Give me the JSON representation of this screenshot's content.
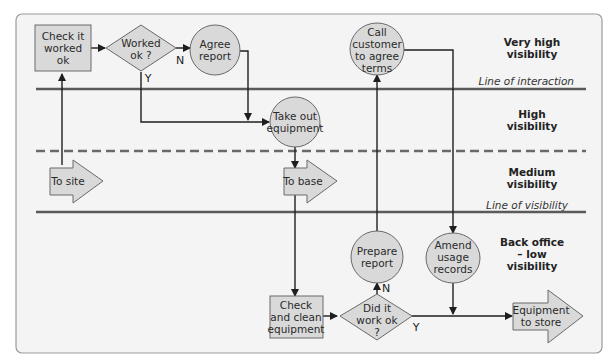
{
  "diagram": {
    "type": "service blueprint",
    "colors": {
      "background": "#f4f4f4",
      "frame": "#9a9a9a",
      "shape_fill": "#d9d9d9",
      "shape_stroke": "#6a6a6a",
      "line": "#5a5a5a",
      "arrow": "#1e1e1e"
    },
    "zones": {
      "very_high": [
        "Very high",
        "visibility"
      ],
      "high": [
        "High",
        "visibility"
      ],
      "medium": [
        "Medium",
        "visibility"
      ],
      "back_office": [
        "Back office",
        "– low",
        "visibility"
      ]
    },
    "lines": {
      "interaction": "Line of interaction",
      "visibility": "Line of visibility"
    },
    "nodes": {
      "check_worked": [
        "Check it",
        "worked",
        "ok"
      ],
      "worked_ok": [
        "Worked",
        "ok ?"
      ],
      "agree_report": [
        "Agree",
        "report"
      ],
      "call_customer": [
        "Call",
        "customer",
        "to agree",
        "terms"
      ],
      "take_out": [
        "Take out",
        "equipment"
      ],
      "to_site": "To site",
      "to_base": "To base",
      "check_clean": [
        "Check",
        "and clean",
        "equipment"
      ],
      "did_it_work": [
        "Did it",
        "work ok",
        "?"
      ],
      "prepare_report": [
        "Prepare",
        "report"
      ],
      "amend_usage": [
        "Amend",
        "usage",
        "records"
      ],
      "equipment_store": [
        "Equipment",
        "to store"
      ]
    },
    "edge_labels": {
      "worked_no": "N",
      "worked_yes": "Y",
      "did_no": "N",
      "did_yes": "Y"
    }
  }
}
